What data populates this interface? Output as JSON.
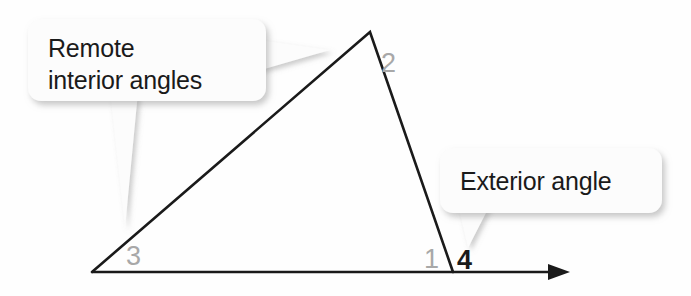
{
  "figure": {
    "background_color": "#fefefe",
    "line_color": "#1a1a1a",
    "interior_label_color": "#a8a8a8",
    "exterior_label_color": "#1a1a1a",
    "callout_fill": "#fcfcfc",
    "callout_shadow_color": "#b5b5b5"
  },
  "triangle": {
    "vertices": {
      "apex": {
        "x": 370,
        "y": 32
      },
      "bottom_left": {
        "x": 92,
        "y": 272
      },
      "bottom_right": {
        "x": 453,
        "y": 272
      }
    },
    "base_ray_end": {
      "x": 557,
      "y": 272
    },
    "arrowhead": "arrow-right"
  },
  "angle_labels": [
    {
      "id": "angle-2",
      "text": "2",
      "x": 381,
      "y": 72,
      "kind": "interior"
    },
    {
      "id": "angle-3",
      "text": "3",
      "x": 126,
      "y": 265,
      "kind": "interior"
    },
    {
      "id": "angle-1",
      "text": "1",
      "x": 424,
      "y": 268,
      "kind": "interior"
    },
    {
      "id": "angle-4",
      "text": "4",
      "x": 457,
      "y": 269,
      "kind": "exterior"
    }
  ],
  "callouts": [
    {
      "id": "remote-interior-angles",
      "lines": [
        "Remote",
        "interior angles"
      ],
      "box": {
        "x": 28,
        "y": 19,
        "width": 238,
        "height": 82,
        "radius": 13
      },
      "text_x": 48,
      "text_line_y": [
        57,
        89
      ],
      "pointers": [
        {
          "name": "pointer-to-apex",
          "shape": "right-wedge"
        },
        {
          "name": "pointer-to-vertex-3",
          "shape": "down-wedge"
        }
      ]
    },
    {
      "id": "exterior-angle",
      "lines": [
        "Exterior angle"
      ],
      "box": {
        "x": 440,
        "y": 148,
        "width": 222,
        "height": 65,
        "radius": 13
      },
      "text_x": 460,
      "text_line_y": [
        190
      ],
      "pointers": [
        {
          "name": "pointer-to-angle-4",
          "shape": "down-wedge"
        }
      ]
    }
  ]
}
